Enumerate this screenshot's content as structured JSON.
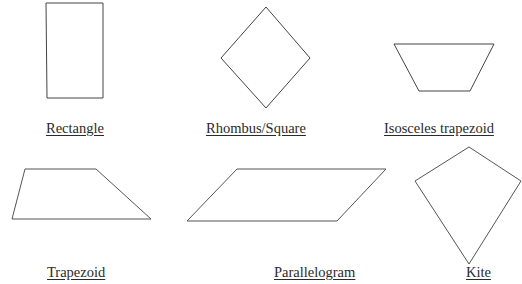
{
  "diagram": {
    "stroke_color": "#444444",
    "background": "#ffffff",
    "shapes": [
      {
        "id": "rectangle",
        "label": "Rectangle",
        "points": [
          [
            46,
            3
          ],
          [
            103,
            3
          ],
          [
            103,
            98
          ],
          [
            47,
            98
          ]
        ]
      },
      {
        "id": "rhombus",
        "label": "Rhombus/Square",
        "points": [
          [
            266,
            7
          ],
          [
            310,
            58
          ],
          [
            266,
            108
          ],
          [
            221,
            58
          ]
        ]
      },
      {
        "id": "isosceles-trapezoid",
        "label": "Isosceles trapezoid",
        "points": [
          [
            394,
            44
          ],
          [
            494,
            44
          ],
          [
            470,
            91
          ],
          [
            419,
            91
          ]
        ]
      },
      {
        "id": "trapezoid",
        "label": "Trapezoid",
        "points": [
          [
            25,
            169
          ],
          [
            96,
            169
          ],
          [
            151,
            219
          ],
          [
            12,
            219
          ]
        ]
      },
      {
        "id": "parallelogram",
        "label": "Parallelogram",
        "points": [
          [
            237,
            169
          ],
          [
            386,
            169
          ],
          [
            337,
            221
          ],
          [
            187,
            221
          ]
        ]
      },
      {
        "id": "kite",
        "label": "Kite",
        "points": [
          [
            469,
            147
          ],
          [
            522,
            182
          ],
          [
            469,
            264
          ],
          [
            415,
            181
          ]
        ]
      }
    ]
  }
}
